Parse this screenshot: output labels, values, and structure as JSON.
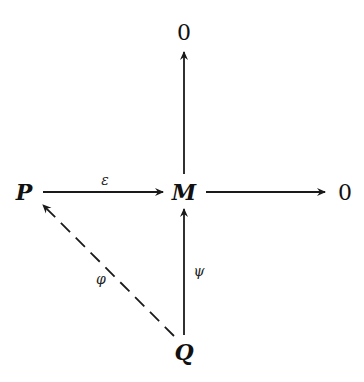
{
  "diagram": {
    "type": "commutative-diagram",
    "nodes": {
      "P": {
        "label": "P",
        "x": 24,
        "y": 200
      },
      "M": {
        "label": "M",
        "x": 184,
        "y": 200
      },
      "zero_top": {
        "label": "0",
        "x": 184,
        "y": 40
      },
      "zero_right": {
        "label": "0",
        "x": 344,
        "y": 200
      },
      "Q": {
        "label": "Q",
        "x": 184,
        "y": 360
      }
    },
    "edges": [
      {
        "from": "P",
        "to": "M",
        "label": "ε",
        "style": "solid"
      },
      {
        "from": "M",
        "to": "zero_right",
        "label": "",
        "style": "solid"
      },
      {
        "from": "M",
        "to": "zero_top",
        "label": "",
        "style": "solid"
      },
      {
        "from": "Q",
        "to": "M",
        "label": "ψ",
        "style": "solid"
      },
      {
        "from": "Q",
        "to": "P",
        "label": "φ",
        "style": "dashed"
      }
    ],
    "labels": {
      "epsilon": "ε",
      "psi": "ψ",
      "phi": "φ"
    }
  }
}
